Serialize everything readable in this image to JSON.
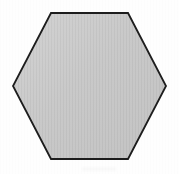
{
  "figure": {
    "shape_name": "hexagon",
    "sides": 6,
    "orientation": "flat-top",
    "background_color": "#fefefe",
    "fill_color": "#c9c9c9",
    "fill_color_light": "#d2d2d2",
    "fill_color_dark": "#c2c2c2",
    "stroke_color": "#1d1d1d",
    "stroke_width": 1.8,
    "texture": "fine vertical halftone striping",
    "canvas": {
      "width": 179,
      "height": 174
    },
    "vertices": [
      {
        "label": "top-left",
        "x": 51,
        "y": 13
      },
      {
        "label": "top-right",
        "x": 128,
        "y": 13
      },
      {
        "label": "right",
        "x": 166,
        "y": 86
      },
      {
        "label": "bottom-right",
        "x": 128,
        "y": 159
      },
      {
        "label": "bottom-left",
        "x": 51,
        "y": 159
      },
      {
        "label": "left",
        "x": 13,
        "y": 86
      }
    ],
    "points_attr": "51,13 128,13 166,86 128,159 51,159 13,86",
    "artifacts": [
      {
        "name": "scan-smudge",
        "x": 82,
        "y": 167,
        "width": 34,
        "height": 4
      }
    ]
  }
}
